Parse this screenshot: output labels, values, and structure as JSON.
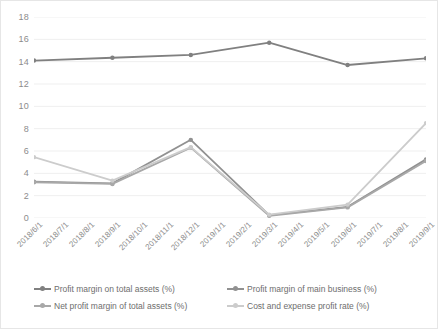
{
  "chart_data": {
    "type": "line",
    "title": "",
    "xlabel": "",
    "ylabel": "",
    "ylim": [
      0,
      18
    ],
    "ytick_step": 2,
    "yticks": [
      0,
      2,
      4,
      6,
      8,
      10,
      12,
      14,
      16,
      18
    ],
    "grid": true,
    "legend_position": "bottom",
    "categories": [
      "2018/6/1",
      "2018/7/1",
      "2018/8/1",
      "2018/9/1",
      "2018/10/1",
      "2018/11/1",
      "2018/12/1",
      "2019/1/1",
      "2019/2/1",
      "2019/3/1",
      "2019/4/1",
      "2019/5/1",
      "2019/6/1",
      "2019/7/1",
      "2019/8/1",
      "2019/9/1"
    ],
    "marker_indices": [
      0,
      3,
      6,
      9,
      12,
      15
    ],
    "series": [
      {
        "name": "Profit margin on total assets (%)",
        "color": "#808080",
        "values": [
          14.1,
          null,
          null,
          14.35,
          null,
          null,
          14.6,
          null,
          null,
          15.7,
          null,
          null,
          13.7,
          null,
          null,
          14.3
        ]
      },
      {
        "name": "Profit margin of main business (%)",
        "color": "#919191",
        "values": [
          3.25,
          null,
          null,
          3.1,
          null,
          null,
          7.0,
          null,
          null,
          0.25,
          null,
          null,
          1.0,
          null,
          null,
          5.25
        ]
      },
      {
        "name": "Net profit margin of total assets (%)",
        "color": "#a8a8a8",
        "values": [
          3.2,
          null,
          null,
          3.05,
          null,
          null,
          6.3,
          null,
          null,
          0.2,
          null,
          null,
          0.95,
          null,
          null,
          5.1
        ]
      },
      {
        "name": "Cost and expense profit rate (%)",
        "color": "#cccccc",
        "values": [
          5.45,
          null,
          null,
          3.35,
          null,
          null,
          6.35,
          null,
          null,
          0.3,
          null,
          null,
          1.2,
          null,
          null,
          8.5
        ]
      }
    ]
  },
  "legend": {
    "items": [
      "Profit margin on total assets (%)",
      "Profit margin of main business (%)",
      "Net profit margin of total assets (%)",
      "Cost and expense profit rate (%)"
    ]
  },
  "colors": {
    "grid": "#efefef",
    "axis_text": "#8c8c8c",
    "legend_text": "#6e6e6e",
    "border": "#e6e6e6",
    "background": "#ffffff"
  }
}
